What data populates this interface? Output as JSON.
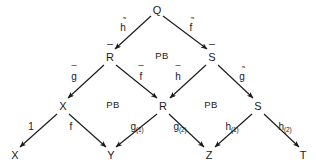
{
  "diagram": {
    "type": "commutative-diagram",
    "background_color": "#ffffff",
    "stroke_color": "#1a1a1a",
    "nodes": [
      {
        "id": "Q",
        "label": "Q",
        "accent": "none",
        "x": 157,
        "y": 10
      },
      {
        "id": "Rbar",
        "label": "R",
        "accent": "bar",
        "x": 110,
        "y": 57
      },
      {
        "id": "Sbar",
        "label": "S",
        "accent": "bar",
        "x": 212,
        "y": 57
      },
      {
        "id": "X_mid",
        "label": "X",
        "accent": "none",
        "x": 63,
        "y": 106
      },
      {
        "id": "R_mid",
        "label": "R",
        "accent": "none",
        "x": 163,
        "y": 106
      },
      {
        "id": "S_mid",
        "label": "S",
        "accent": "none",
        "x": 258,
        "y": 106
      },
      {
        "id": "X_bot",
        "label": "X",
        "accent": "none",
        "x": 15,
        "y": 155
      },
      {
        "id": "Y_bot",
        "label": "Y",
        "accent": "none",
        "x": 111,
        "y": 155
      },
      {
        "id": "Z_bot",
        "label": "Z",
        "accent": "none",
        "x": 209,
        "y": 155
      },
      {
        "id": "T_bot",
        "label": "T",
        "accent": "none",
        "x": 303,
        "y": 155
      }
    ],
    "edges": [
      {
        "from": "Q",
        "to": "Rbar",
        "label": "h",
        "accent": "tilde",
        "label_x": 123,
        "label_y": 28,
        "sub": ""
      },
      {
        "from": "Q",
        "to": "Sbar",
        "label": "f",
        "accent": "tilde",
        "label_x": 191,
        "label_y": 28,
        "sub": ""
      },
      {
        "from": "Rbar",
        "to": "X_mid",
        "label": "g",
        "accent": "bar",
        "label_x": 74,
        "label_y": 77,
        "sub": ""
      },
      {
        "from": "Rbar",
        "to": "R_mid",
        "label": "f",
        "accent": "bar",
        "label_x": 141,
        "label_y": 77,
        "sub": ""
      },
      {
        "from": "Sbar",
        "to": "R_mid",
        "label": "h",
        "accent": "bar",
        "label_x": 178,
        "label_y": 77,
        "sub": ""
      },
      {
        "from": "Sbar",
        "to": "S_mid",
        "label": "g",
        "accent": "tilde",
        "label_x": 242,
        "label_y": 77,
        "sub": ""
      },
      {
        "from": "X_mid",
        "to": "X_bot",
        "label": "1",
        "accent": "none",
        "label_x": 31,
        "label_y": 127,
        "sub": ""
      },
      {
        "from": "X_mid",
        "to": "Y_bot",
        "label": "f",
        "accent": "none",
        "label_x": 71,
        "label_y": 127,
        "sub": ""
      },
      {
        "from": "R_mid",
        "to": "Y_bot",
        "label": "g",
        "accent": "none",
        "label_x": 137,
        "label_y": 128,
        "sub": "(1)"
      },
      {
        "from": "R_mid",
        "to": "Z_bot",
        "label": "g",
        "accent": "none",
        "label_x": 180,
        "label_y": 128,
        "sub": "(2)"
      },
      {
        "from": "S_mid",
        "to": "Z_bot",
        "label": "h",
        "accent": "none",
        "label_x": 232,
        "label_y": 128,
        "sub": "(1)"
      },
      {
        "from": "S_mid",
        "to": "T_bot",
        "label": "h",
        "accent": "none",
        "label_x": 285,
        "label_y": 128,
        "sub": "(2)"
      }
    ],
    "region_labels": [
      {
        "text": "PB",
        "x": 162,
        "y": 56
      },
      {
        "text": "PB",
        "x": 113,
        "y": 105
      },
      {
        "text": "PB",
        "x": 211,
        "y": 105
      }
    ]
  }
}
